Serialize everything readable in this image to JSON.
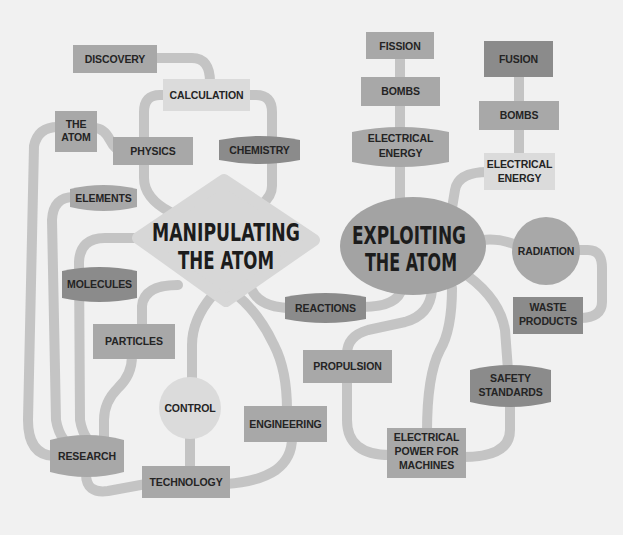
{
  "colors": {
    "background": "#f1f1f1",
    "connector": "#c4c4c4",
    "node_mid": "#a8a8a8",
    "node_dark": "#8b8b8b",
    "node_light": "#dbdbdb",
    "exploiting_ellipse": "#a3a3a3",
    "manipulating_diamond": "#d7d7d7",
    "text": "#242424",
    "central_text": "#1c1c1c"
  },
  "central": {
    "manipulating": {
      "lines": [
        "MANIPULATING",
        "THE ATOM"
      ]
    },
    "exploiting": {
      "lines": [
        "EXPLOITING",
        "THE ATOM"
      ]
    }
  },
  "nodes": {
    "discovery": {
      "lines": [
        "DISCOVERY"
      ]
    },
    "calculation": {
      "lines": [
        "CALCULATION"
      ]
    },
    "the_atom": {
      "lines": [
        "THE",
        "ATOM"
      ]
    },
    "physics": {
      "lines": [
        "PHYSICS"
      ]
    },
    "chemistry": {
      "lines": [
        "CHEMISTRY"
      ]
    },
    "elements": {
      "lines": [
        "ELEMENTS"
      ]
    },
    "molecules": {
      "lines": [
        "MOLECULES"
      ]
    },
    "particles": {
      "lines": [
        "PARTICLES"
      ]
    },
    "reactions": {
      "lines": [
        "REACTIONS"
      ]
    },
    "research": {
      "lines": [
        "RESEARCH"
      ]
    },
    "technology": {
      "lines": [
        "TECHNOLOGY"
      ]
    },
    "control": {
      "lines": [
        "CONTROL"
      ]
    },
    "engineering": {
      "lines": [
        "ENGINEERING"
      ]
    },
    "propulsion": {
      "lines": [
        "PROPULSION"
      ]
    },
    "electrical_power": {
      "lines": [
        "ELECTRICAL",
        "POWER FOR",
        "MACHINES"
      ]
    },
    "safety_standards": {
      "lines": [
        "SAFETY",
        "STANDARDS"
      ]
    },
    "waste_products": {
      "lines": [
        "WASTE",
        "PRODUCTS"
      ]
    },
    "radiation": {
      "lines": [
        "RADIATION"
      ]
    },
    "fission": {
      "lines": [
        "FISSION"
      ]
    },
    "fission_bombs": {
      "lines": [
        "BOMBS"
      ]
    },
    "fission_electrical_energy": {
      "lines": [
        "ELECTRICAL",
        "ENERGY"
      ]
    },
    "fusion": {
      "lines": [
        "FUSION"
      ]
    },
    "fusion_bombs": {
      "lines": [
        "BOMBS"
      ]
    },
    "fusion_electrical_energy": {
      "lines": [
        "ELECTRICAL",
        "ENERGY"
      ]
    }
  },
  "edges": [
    [
      "discovery",
      "calculation"
    ],
    [
      "calculation",
      "physics"
    ],
    [
      "calculation",
      "chemistry"
    ],
    [
      "physics",
      "manipulating"
    ],
    [
      "chemistry",
      "manipulating"
    ],
    [
      "the_atom",
      "physics"
    ],
    [
      "the_atom",
      "research"
    ],
    [
      "elements",
      "research"
    ],
    [
      "manipulating",
      "molecules"
    ],
    [
      "molecules",
      "research"
    ],
    [
      "manipulating",
      "particles"
    ],
    [
      "particles",
      "research"
    ],
    [
      "manipulating",
      "control"
    ],
    [
      "manipulating",
      "engineering"
    ],
    [
      "manipulating",
      "reactions"
    ],
    [
      "control",
      "technology"
    ],
    [
      "research",
      "technology"
    ],
    [
      "technology",
      "engineering"
    ],
    [
      "reactions",
      "exploiting"
    ],
    [
      "exploiting",
      "propulsion"
    ],
    [
      "exploiting",
      "electrical_power"
    ],
    [
      "exploiting",
      "safety_standards"
    ],
    [
      "propulsion",
      "electrical_power"
    ],
    [
      "safety_standards",
      "electrical_power"
    ],
    [
      "exploiting",
      "radiation"
    ],
    [
      "radiation",
      "waste_products"
    ],
    [
      "fission",
      "fission_bombs"
    ],
    [
      "fission_bombs",
      "fission_electrical_energy"
    ],
    [
      "fission_electrical_energy",
      "exploiting"
    ],
    [
      "fusion",
      "fusion_bombs"
    ],
    [
      "fusion_bombs",
      "fusion_electrical_energy"
    ],
    [
      "fusion_electrical_energy",
      "exploiting"
    ]
  ]
}
